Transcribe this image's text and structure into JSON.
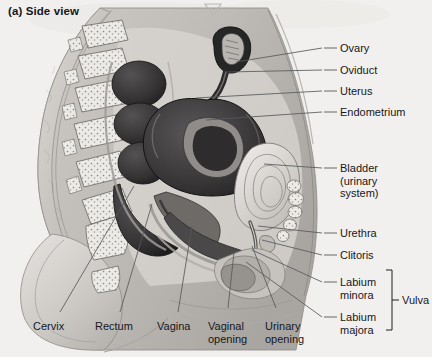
{
  "figure": {
    "title": "(a) Side view",
    "background_color": "#f2f0ee",
    "ink_color": "#16171b",
    "leader_color": "#5d5f63"
  },
  "top_artifacts": {
    "chevron_icon": "down-triangle-outline",
    "bleed_text": "scan bleed-through"
  },
  "right_labels": [
    {
      "id": "ovary",
      "text": "Ovary",
      "x": 340,
      "y": 42,
      "tick_x1": 322,
      "tick_x2": 337,
      "tick_y": 48,
      "lead_x": 236,
      "lead_y": 62
    },
    {
      "id": "oviduct",
      "text": "Oviduct",
      "x": 340,
      "y": 64,
      "tick_x1": 322,
      "tick_x2": 337,
      "tick_y": 70,
      "lead_x": 228,
      "lead_y": 70
    },
    {
      "id": "uterus",
      "text": "Uterus",
      "x": 340,
      "y": 85,
      "tick_x1": 322,
      "tick_x2": 337,
      "tick_y": 91,
      "lead_x": 196,
      "lead_y": 96
    },
    {
      "id": "endometrium",
      "text": "Endometrium",
      "x": 340,
      "y": 106,
      "tick_x1": 322,
      "tick_x2": 337,
      "tick_y": 112,
      "lead_x": 204,
      "lead_y": 118
    },
    {
      "id": "bladder",
      "text": "Bladder\n(urinary\nsystem)",
      "x": 340,
      "y": 162,
      "tick_x1": 322,
      "tick_x2": 337,
      "tick_y": 168,
      "lead_x": 262,
      "lead_y": 163
    },
    {
      "id": "urethra",
      "text": "Urethra",
      "x": 340,
      "y": 227,
      "tick_x1": 322,
      "tick_x2": 337,
      "tick_y": 233,
      "lead_x": 258,
      "lead_y": 225
    },
    {
      "id": "clitoris",
      "text": "Clitoris",
      "x": 340,
      "y": 249,
      "tick_x1": 322,
      "tick_x2": 337,
      "tick_y": 255,
      "lead_x": 256,
      "lead_y": 238
    },
    {
      "id": "labium-minora",
      "text": "Labium\nminora",
      "x": 340,
      "y": 276,
      "tick_x1": 322,
      "tick_x2": 337,
      "tick_y": 282,
      "lead_x": 252,
      "lead_y": 248
    },
    {
      "id": "labium-majora",
      "text": "Labium\nmajora",
      "x": 340,
      "y": 311,
      "tick_x1": 322,
      "tick_x2": 337,
      "tick_y": 317,
      "lead_x": 248,
      "lead_y": 258
    }
  ],
  "bracket": {
    "label": "Vulva",
    "label_x": 405,
    "label_y": 293,
    "top_y": 272,
    "bottom_y": 330,
    "x": 392
  },
  "bottom_labels": [
    {
      "id": "cervix",
      "text": "Cervix",
      "x": 33,
      "y": 320,
      "lead_x1": 57,
      "lead_y1": 316,
      "lead_x2": 133,
      "lead_y2": 188
    },
    {
      "id": "rectum",
      "text": "Rectum",
      "x": 95,
      "y": 320,
      "lead_x1": 117,
      "lead_y1": 316,
      "lead_x2": 150,
      "lead_y2": 205
    },
    {
      "id": "vagina",
      "text": "Vagina",
      "x": 157,
      "y": 320,
      "lead_x1": 175,
      "lead_y1": 316,
      "lead_x2": 190,
      "lead_y2": 228
    },
    {
      "id": "vaginal-opening",
      "text": "Vaginal\nopening",
      "x": 208,
      "y": 320,
      "lead_x1": 224,
      "lead_y1": 312,
      "lead_x2": 232,
      "lead_y2": 252
    },
    {
      "id": "urinary-opening",
      "text": "Urinary\nopening",
      "x": 265,
      "y": 320,
      "lead_x1": 275,
      "lead_y1": 312,
      "lead_x2": 252,
      "lead_y2": 246
    }
  ]
}
